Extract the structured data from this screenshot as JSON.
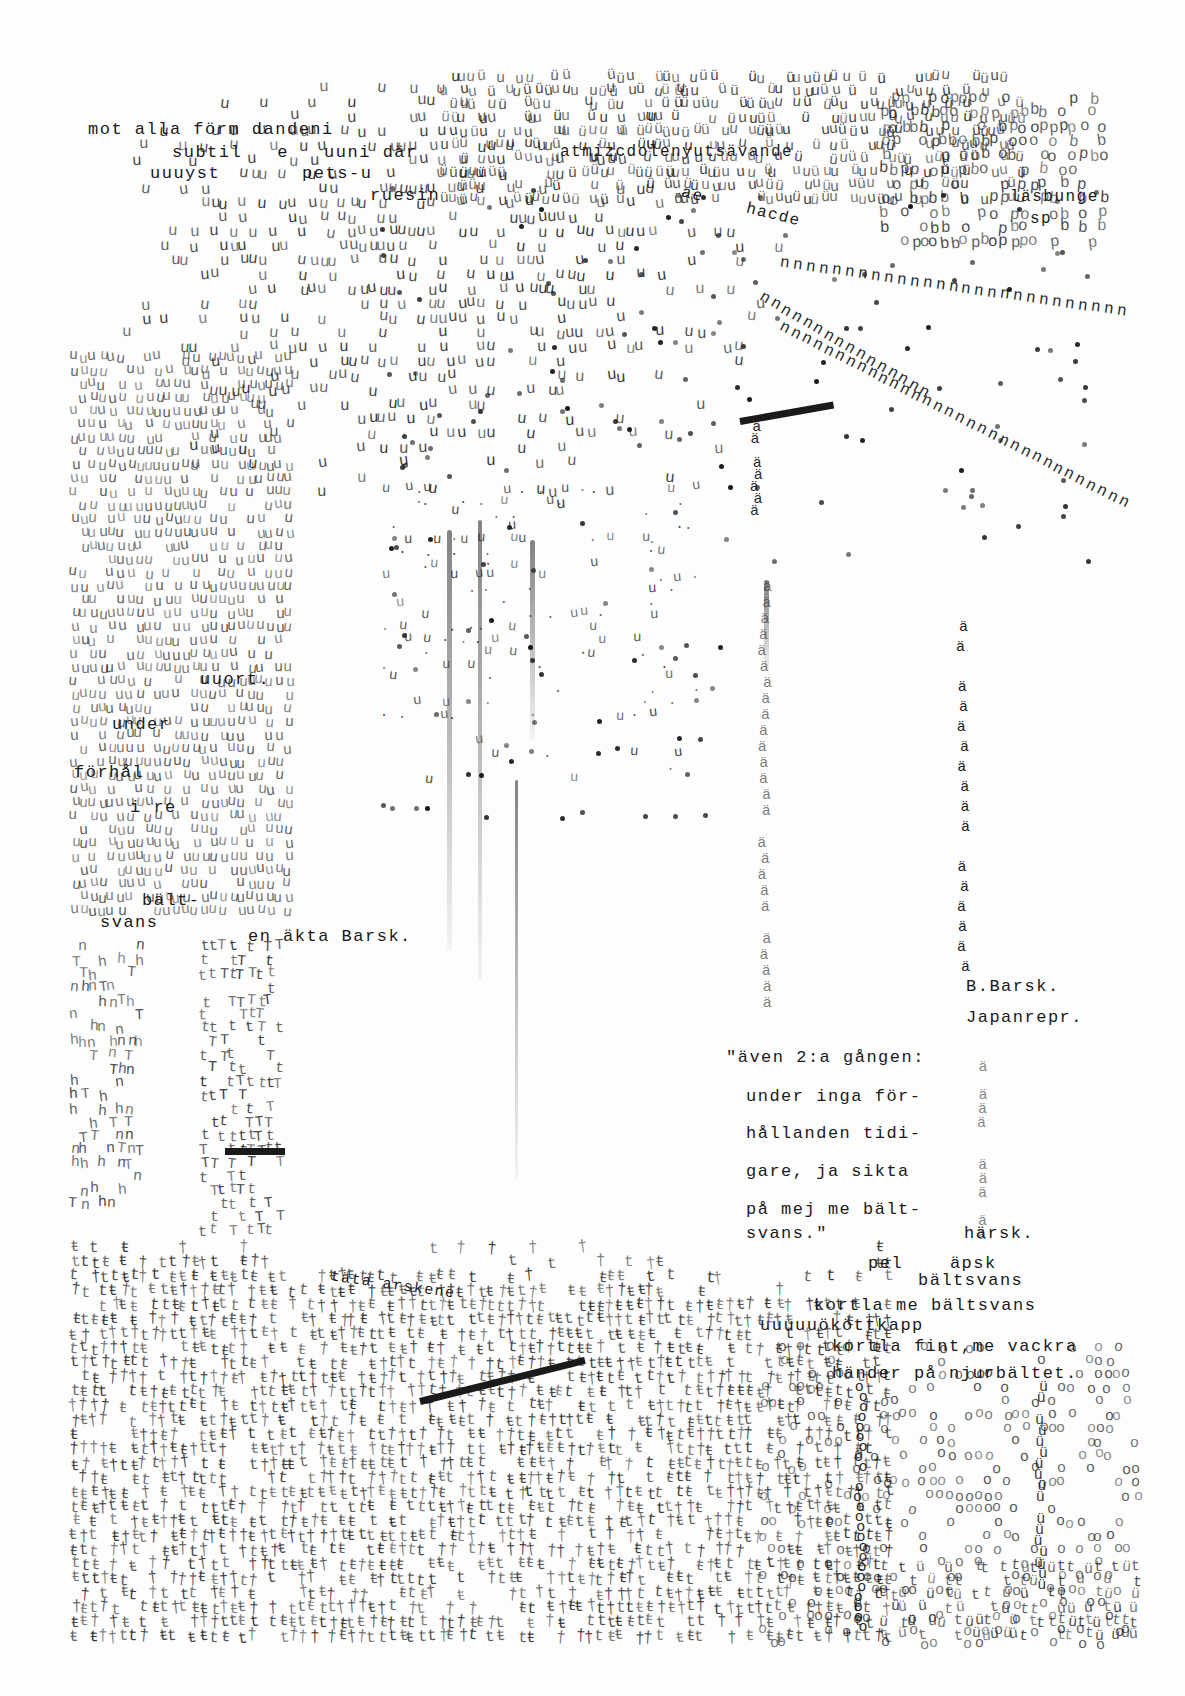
{
  "artwork": {
    "medium": "typewriter concrete poem",
    "colors": {
      "ink": "#111111",
      "paper": "#fdfdfd",
      "faded_ink": "#777777"
    }
  },
  "text_passages": {
    "top_left": [
      {
        "text": "mot alla förm dandeni",
        "x": 88,
        "y": 127
      },
      {
        "text": "subtil   e   uuni där",
        "x": 172,
        "y": 150
      },
      {
        "text": "uuuyst       pets-u",
        "x": 150,
        "y": 171
      },
      {
        "text": "ruesin",
        "x": 370,
        "y": 193
      }
    ],
    "top_right_fragments": [
      {
        "text": "atmizcdolenyutsävande",
        "x": 560,
        "y": 150
      },
      {
        "text": "ae    hacde",
        "x": 680,
        "y": 205
      },
      {
        "text": "läsbunge",
        "x": 1010,
        "y": 195
      },
      {
        "text": "sp",
        "x": 1030,
        "y": 215
      }
    ],
    "left_column_fragments": [
      {
        "text": "uuort.",
        "x": 200,
        "y": 678
      },
      {
        "text": "under",
        "x": 112,
        "y": 722
      },
      {
        "text": "förhål",
        "x": 74,
        "y": 770
      },
      {
        "text": "i re",
        "x": 130,
        "y": 805
      },
      {
        "text": "bält-",
        "x": 142,
        "y": 898
      },
      {
        "text": "svans",
        "x": 100,
        "y": 920
      }
    ],
    "middle_left": {
      "text": "en äkta Barsk.",
      "x": 248,
      "y": 935
    },
    "signature": [
      {
        "text": "B.Barsk.",
        "x": 966,
        "y": 985
      },
      {
        "text": "Japanrepr.",
        "x": 966,
        "y": 1016
      }
    ],
    "quote": [
      {
        "text": "\"även 2:a gången:",
        "x": 726,
        "y": 1056
      },
      {
        "text": "under inga för-",
        "x": 746,
        "y": 1095
      },
      {
        "text": "hållanden tidi-",
        "x": 746,
        "y": 1132
      },
      {
        "text": "gare, ja sikta",
        "x": 746,
        "y": 1170
      },
      {
        "text": "på mej me bält-",
        "x": 746,
        "y": 1208
      },
      {
        "text": "svans.\"",
        "x": 746,
        "y": 1230
      }
    ],
    "harsk": {
      "text": "härsk.",
      "x": 964,
      "y": 1232
    },
    "lower_right": [
      {
        "text": "pel    äpsk",
        "x": 868,
        "y": 1262
      },
      {
        "text": "bältsvans",
        "x": 918,
        "y": 1279
      },
      {
        "text": "kortla me bältsvans",
        "x": 814,
        "y": 1304
      },
      {
        "text": "uuuuuököttkapp",
        "x": 760,
        "y": 1324
      },
      {
        "text": "kortla fint,me vackra",
        "x": 832,
        "y": 1345
      },
      {
        "text": "händer på njurbältet.",
        "x": 832,
        "y": 1372
      }
    ],
    "bottom_left_fragment": {
      "text": "täta arskene",
      "x": 330,
      "y": 1285
    }
  },
  "texture_fields": [
    {
      "name": "top-cloud-u",
      "glyph": "u",
      "x": 120,
      "y": 80,
      "w": 680,
      "h": 420,
      "density": 0.55,
      "size": 16,
      "opacity": 0.85,
      "shape": "cloud"
    },
    {
      "name": "top-band-dense",
      "glyph": "uü",
      "x": 440,
      "y": 70,
      "w": 580,
      "h": 130,
      "density": 0.6,
      "size": 15,
      "opacity": 0.85,
      "shape": "band"
    },
    {
      "name": "top-right-p-cluster",
      "glyph": "pob",
      "x": 880,
      "y": 90,
      "w": 220,
      "h": 150,
      "density": 0.55,
      "size": 16,
      "opacity": 0.8,
      "shape": "band"
    },
    {
      "name": "left-u-grid",
      "glyph": "u",
      "x": 70,
      "y": 350,
      "w": 220,
      "h": 560,
      "density": 0.7,
      "size": 15,
      "opacity": 0.7,
      "shape": "band"
    },
    {
      "name": "center-spray-u",
      "glyph": "u.",
      "x": 380,
      "y": 480,
      "w": 320,
      "h": 330,
      "density": 0.18,
      "size": 14,
      "opacity": 0.8,
      "shape": "spray"
    },
    {
      "name": "left-drip-n",
      "glyph": "nhT",
      "x": 70,
      "y": 940,
      "w": 70,
      "h": 260,
      "density": 0.45,
      "size": 15,
      "opacity": 0.8,
      "shape": "band"
    },
    {
      "name": "left-column-t",
      "glyph": "tT",
      "x": 200,
      "y": 940,
      "w": 80,
      "h": 290,
      "density": 0.55,
      "size": 15,
      "opacity": 0.85,
      "shape": "band"
    },
    {
      "name": "bottom-field-t",
      "glyph": "tŧ†",
      "x": 70,
      "y": 1240,
      "w": 820,
      "h": 400,
      "density": 0.75,
      "size": 16,
      "opacity": 0.85,
      "shape": "slope"
    },
    {
      "name": "bottom-circles",
      "glyph": "o",
      "x": 760,
      "y": 1340,
      "w": 380,
      "h": 300,
      "density": 0.28,
      "size": 15,
      "opacity": 0.75,
      "shape": "band"
    },
    {
      "name": "bottom-right-t",
      "glyph": "tü",
      "x": 880,
      "y": 1560,
      "w": 260,
      "h": 80,
      "density": 0.6,
      "size": 15,
      "opacity": 0.8,
      "shape": "band"
    }
  ],
  "ray_lines": [
    {
      "name": "ray-n-upper",
      "glyph": "n",
      "x1": 780,
      "y1": 255,
      "x2": 1130,
      "y2": 305,
      "step": 13
    },
    {
      "name": "ray-n-lower",
      "glyph": "n",
      "x1": 780,
      "y1": 320,
      "x2": 1130,
      "y2": 500,
      "step": 12
    },
    {
      "name": "ray-n-mid",
      "glyph": "n",
      "x1": 760,
      "y1": 290,
      "x2": 930,
      "y2": 390,
      "step": 12
    }
  ],
  "columns": [
    {
      "name": "a-umlaut-column-left",
      "glyph": "ä",
      "x": 760,
      "y": 580,
      "h": 430,
      "step": 16,
      "opacity": 0.55
    },
    {
      "name": "a-umlaut-column-right",
      "glyph": "ä",
      "x": 958,
      "y": 620,
      "h": 350,
      "step": 20,
      "opacity": 0.95
    },
    {
      "name": "a-umlaut-column-quote-edge",
      "glyph": "ä",
      "x": 978,
      "y": 1060,
      "h": 180,
      "step": 14,
      "opacity": 0.5
    },
    {
      "name": "circle-column-1",
      "glyph": "o",
      "x": 856,
      "y": 1380,
      "h": 260,
      "step": 10,
      "opacity": 0.9
    },
    {
      "name": "circle-column-2",
      "glyph": "ü",
      "x": 1036,
      "y": 1380,
      "h": 200,
      "step": 11,
      "opacity": 0.85
    },
    {
      "name": "barrel-column",
      "glyph": "ä",
      "x": 752,
      "y": 420,
      "h": 90,
      "step": 12,
      "opacity": 0.9
    }
  ],
  "streaks": [
    {
      "x": 447,
      "y": 530,
      "w": 5,
      "h": 420
    },
    {
      "x": 478,
      "y": 520,
      "w": 4,
      "h": 460
    },
    {
      "x": 530,
      "y": 540,
      "w": 5,
      "h": 200
    },
    {
      "x": 515,
      "y": 780,
      "w": 3,
      "h": 400
    },
    {
      "x": 764,
      "y": 580,
      "w": 5,
      "h": 90
    }
  ],
  "rule_bars": [
    {
      "x": 740,
      "y": 418,
      "w": 95,
      "angle": -10
    },
    {
      "x": 225,
      "y": 1148,
      "w": 60,
      "angle": 0
    },
    {
      "x": 420,
      "y": 1398,
      "w": 170,
      "angle": -14
    }
  ]
}
